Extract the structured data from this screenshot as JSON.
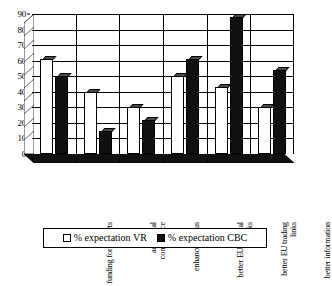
{
  "chart_data": {
    "type": "bar",
    "title": "",
    "subtitle": "",
    "xlabel": "",
    "ylabel": "",
    "ylim": [
      0,
      90
    ],
    "ytick_labels": [
      "0",
      "10",
      "20",
      "30",
      "40",
      "50",
      "60",
      "70",
      "80",
      "90"
    ],
    "ytick_values": [
      0,
      10,
      20,
      30,
      40,
      50,
      60,
      70,
      80,
      90
    ],
    "grid": true,
    "legend_position": "bottom",
    "categories": [
      "funding for projects",
      "additional competence",
      "enhanced status",
      "better EU cultural links",
      "better EU trading links",
      "better information"
    ],
    "series": [
      {
        "name": "% expectation VR",
        "color": "#ffffff",
        "values": [
          61,
          40,
          30,
          50,
          43,
          30
        ]
      },
      {
        "name": "% expectation CBC",
        "color": "#111111",
        "values": [
          50,
          15,
          22,
          61,
          88,
          54
        ]
      }
    ]
  },
  "legend": {
    "items": [
      {
        "label": "% expectation VR",
        "swatch": "white-square"
      },
      {
        "label": "% expectation CBC",
        "swatch": "black-square"
      }
    ]
  }
}
